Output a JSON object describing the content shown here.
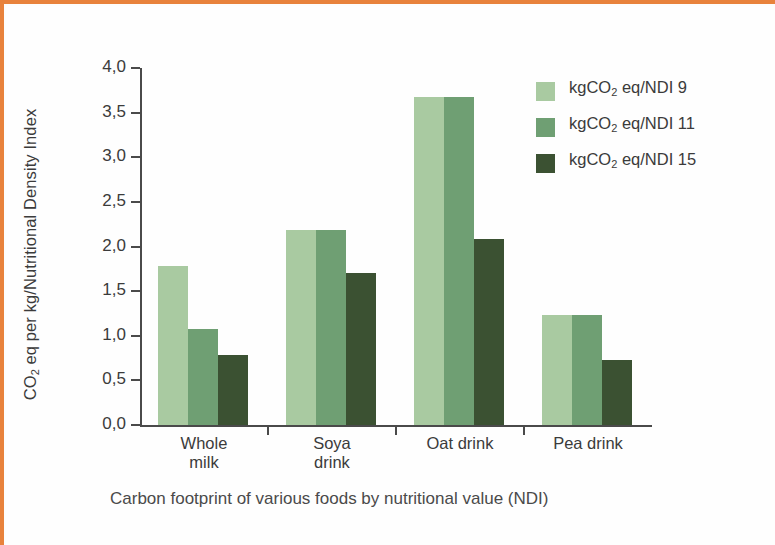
{
  "frame": {
    "border_color": "#e8823c",
    "background": "#fefefe"
  },
  "chart_data": {
    "type": "bar",
    "title": "",
    "caption": "Carbon footprint of various foods by nutritional value (NDI)",
    "ylabel_prefix": "CO",
    "ylabel_sub": "2",
    "ylabel_suffix": " eq per kg/Nutritional Density Index",
    "xlabel": "",
    "categories": [
      "Whole milk",
      "Soya drink",
      "Oat drink",
      "Pea drink"
    ],
    "category_lines": [
      [
        "Whole",
        "milk"
      ],
      [
        "Soya",
        "drink"
      ],
      [
        "Oat drink"
      ],
      [
        "Pea drink"
      ]
    ],
    "series": [
      {
        "name": "kgCO2 eq/NDI 9",
        "label_prefix": "kgCO",
        "label_sub": "2",
        "label_suffix": " eq/NDI 9",
        "color": "#a9caa1",
        "values": [
          1.78,
          2.18,
          3.68,
          1.23
        ]
      },
      {
        "name": "kgCO2 eq/NDI 11",
        "label_prefix": "kgCO",
        "label_sub": "2",
        "label_suffix": " eq/NDI 11",
        "color": "#6f9f73",
        "values": [
          1.08,
          2.18,
          3.68,
          1.23
        ]
      },
      {
        "name": "kgCO2 eq/NDI 15",
        "label_prefix": "kgCO",
        "label_sub": "2",
        "label_suffix": " eq/NDI 15",
        "color": "#3b5132",
        "values": [
          0.78,
          1.7,
          2.08,
          0.73
        ]
      }
    ],
    "ylim": [
      0.0,
      4.0
    ],
    "ytick_values": [
      0.0,
      0.5,
      1.0,
      1.5,
      2.0,
      2.5,
      3.0,
      3.5,
      4.0
    ],
    "ytick_labels": [
      "0,0",
      "0,5",
      "1,0",
      "1,5",
      "2,0",
      "2,5",
      "3,0",
      "3,5",
      "4,0"
    ],
    "grid": false,
    "legend_position": "top-right",
    "decimal_separator": ","
  }
}
